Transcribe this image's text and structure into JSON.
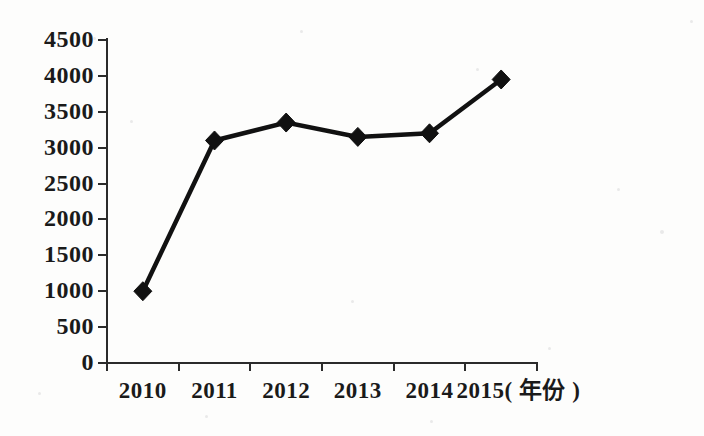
{
  "chart_data": {
    "type": "line",
    "title": "",
    "subtitle": "",
    "xlabel": "年份",
    "ylabel": "",
    "categories": [
      "2010",
      "2011",
      "2012",
      "2013",
      "2014",
      "2015"
    ],
    "values": [
      1000,
      3100,
      3350,
      3150,
      3200,
      3950
    ],
    "series": [
      {
        "name": "",
        "values": [
          1000,
          3100,
          3350,
          3150,
          3200,
          3950
        ]
      }
    ],
    "ylim": [
      0,
      4500
    ],
    "y_ticks": [
      0,
      500,
      1000,
      1500,
      2000,
      2500,
      3000,
      3500,
      4000,
      4500
    ],
    "y_tick_labels": [
      "0",
      "500",
      "1000",
      "1500",
      "2000",
      "2500",
      "3000",
      "3500",
      "4000",
      "4500"
    ],
    "x_tick_labels": [
      "2010",
      "2011",
      "2012",
      "2013",
      "2014",
      "2015"
    ],
    "x_axis_unit_label": "2015( 年份 )",
    "grid": false,
    "legend": false,
    "legend_position": "none",
    "marker": "diamond",
    "line_color": "#111111",
    "marker_color": "#111111",
    "axis_color": "#2b2b2b",
    "background_color": "#fdfdfc",
    "annotations": []
  },
  "axis": {
    "y_labels": [
      "4500",
      "4000",
      "3500",
      "3000",
      "2500",
      "2000",
      "1500",
      "1000",
      "500",
      "0"
    ],
    "x_labels": [
      "2010",
      "2011",
      "2012",
      "2013",
      "2014",
      "2015"
    ],
    "unit_suffix": "( 年份 )",
    "last_x_label_with_unit": "2015( 年份 )"
  }
}
